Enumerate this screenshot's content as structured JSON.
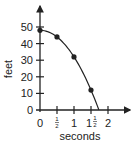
{
  "chart_data": {
    "type": "scatter",
    "title": "",
    "xlabel": "seconds",
    "ylabel": "feet",
    "x_ticks": [
      {
        "value": 0,
        "label": "0"
      },
      {
        "value": 0.5,
        "label": "1/2"
      },
      {
        "value": 1,
        "label": "1"
      },
      {
        "value": 1.5,
        "label": "1 1/2"
      },
      {
        "value": 2,
        "label": "2"
      }
    ],
    "y_ticks": [
      0,
      10,
      20,
      30,
      40,
      50
    ],
    "xlim": [
      0,
      2.3
    ],
    "ylim": [
      0,
      58
    ],
    "grid": false,
    "legend": null,
    "series": [
      {
        "name": "height",
        "points": [
          {
            "x": 0,
            "y": 48
          },
          {
            "x": 0.5,
            "y": 44
          },
          {
            "x": 1,
            "y": 32
          },
          {
            "x": 1.5,
            "y": 12
          }
        ],
        "fitted_curve": "y = 48 - 16x^2",
        "curve_end_x": 1.73
      }
    ],
    "colors": {
      "ink": "#222222",
      "background": "#ffffff"
    }
  },
  "labels": {
    "x_axis_title": "seconds",
    "y_axis_title": "feet",
    "y_tick_0": "0",
    "y_tick_10": "10",
    "y_tick_20": "20",
    "y_tick_30": "30",
    "y_tick_40": "40",
    "y_tick_50": "50",
    "x_tick_0": "0",
    "x_tick_half_num": "1",
    "x_tick_half_den": "2",
    "x_tick_1": "1",
    "x_tick_1half_whole": "1",
    "x_tick_1half_num": "1",
    "x_tick_1half_den": "2",
    "x_tick_2": "2"
  }
}
